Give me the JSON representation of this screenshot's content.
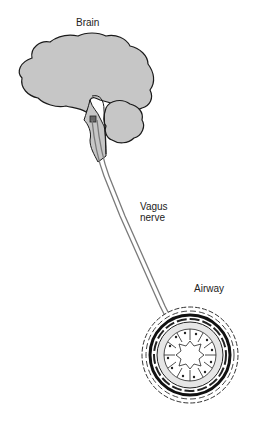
{
  "diagram": {
    "labels": {
      "brain": "Brain",
      "vagus_line1": "Vagus",
      "vagus_line2": "nerve",
      "airway": "Airway"
    },
    "colors": {
      "tissue_fill": "#c6c6c6",
      "outline": "#1a1a1a",
      "nerve": "#7a7a7a",
      "background": "#ffffff"
    }
  }
}
